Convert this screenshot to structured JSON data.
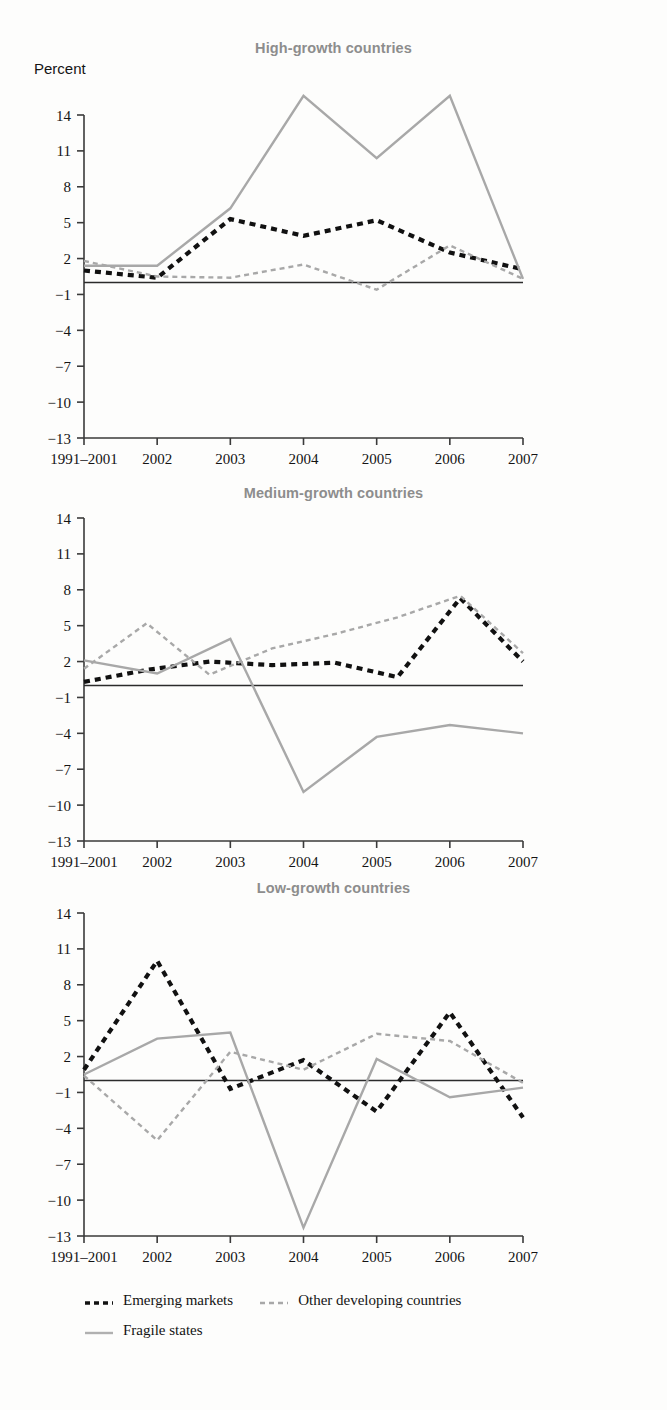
{
  "figure": {
    "y_unit_label": "Percent",
    "background_color": "#fdfdfc"
  },
  "legend": {
    "position": "bottom-left",
    "rows": [
      [
        {
          "label": "Emerging markets",
          "style": "dashed",
          "color": "#111111",
          "swatch": "dashed-black-swatch"
        },
        {
          "label": "Other developing countries",
          "style": "dashed",
          "color": "#a8a8a8",
          "swatch": "dashed-gray-swatch"
        }
      ],
      [
        {
          "label": "Fragile states",
          "style": "solid",
          "color": "#a8a8a8",
          "swatch": "solid-gray-swatch"
        }
      ]
    ]
  },
  "chart_data": [
    {
      "type": "line",
      "title": "High-growth countries",
      "xlabel": "",
      "ylabel": "Percent",
      "x": [
        "1991–2001",
        "2002",
        "2003",
        "2004",
        "2005",
        "2006",
        "2007"
      ],
      "yticks": [
        14,
        11,
        8,
        5,
        2,
        -1,
        -4,
        -7,
        -10,
        -13
      ],
      "ylim": [
        -13,
        14
      ],
      "grid": false,
      "zero_line": true,
      "series": [
        {
          "name": "Emerging markets",
          "style": "dashed",
          "color": "#111111",
          "values": [
            1.0,
            0.4,
            5.3,
            3.9,
            5.2,
            2.5,
            1.1
          ]
        },
        {
          "name": "Other developing countries",
          "style": "dashed",
          "color": "#a8a8a8",
          "values": [
            1.8,
            0.5,
            0.4,
            1.5,
            -0.6,
            3.1,
            0.3
          ]
        },
        {
          "name": "Fragile states",
          "style": "solid",
          "color": "#a8a8a8",
          "values": [
            1.4,
            1.4,
            6.2,
            15.6,
            10.4,
            15.6,
            0.3
          ]
        }
      ]
    },
    {
      "type": "line",
      "title": "Medium-growth countries",
      "xlabel": "",
      "ylabel": "",
      "x": [
        "1991–2001",
        "2002",
        "2003",
        "2004",
        "2005",
        "2006",
        "2007"
      ],
      "yticks": [
        14,
        11,
        8,
        5,
        2,
        -1,
        -4,
        -7,
        -10,
        -13
      ],
      "ylim": [
        -13,
        14
      ],
      "grid": false,
      "zero_line": true,
      "series": [
        {
          "name": "Emerging markets",
          "style": "dashed",
          "color": "#111111",
          "values": [
            0.3,
            1.3,
            2.0,
            1.7,
            1.9,
            0.7,
            7.3,
            2.0
          ]
        },
        {
          "name": "Other developing countries",
          "style": "dashed",
          "color": "#a8a8a8",
          "values": [
            1.4,
            5.2,
            0.9,
            3.1,
            4.3,
            5.7,
            7.5,
            2.7
          ]
        },
        {
          "name": "Fragile states",
          "style": "solid",
          "color": "#a8a8a8",
          "values": [
            2.1,
            1.0,
            3.9,
            -8.9,
            -4.3,
            -3.3,
            -4.0
          ]
        }
      ]
    },
    {
      "type": "line",
      "title": "Low-growth countries",
      "xlabel": "",
      "ylabel": "",
      "x": [
        "1991–2001",
        "2002",
        "2003",
        "2004",
        "2005",
        "2006",
        "2007"
      ],
      "yticks": [
        14,
        11,
        8,
        5,
        2,
        -1,
        -4,
        -7,
        -10,
        -13
      ],
      "ylim": [
        -13,
        14
      ],
      "grid": false,
      "zero_line": true,
      "series": [
        {
          "name": "Emerging markets",
          "style": "dashed",
          "color": "#111111",
          "values": [
            0.9,
            10.0,
            -0.7,
            1.7,
            -2.6,
            5.7,
            -3.1
          ]
        },
        {
          "name": "Other developing countries",
          "style": "dashed",
          "color": "#a8a8a8",
          "values": [
            0.4,
            -5.0,
            2.4,
            0.9,
            3.9,
            3.3,
            -0.2
          ]
        },
        {
          "name": "Fragile states",
          "style": "solid",
          "color": "#a8a8a8",
          "values": [
            0.5,
            3.5,
            4.0,
            -12.3,
            1.8,
            -1.4,
            -0.6
          ]
        }
      ]
    }
  ]
}
